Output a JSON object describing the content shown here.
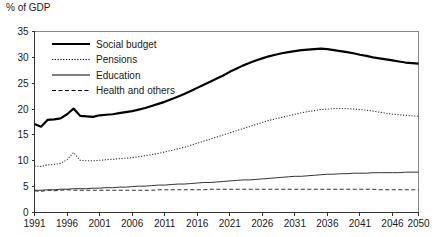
{
  "chart_data": {
    "type": "line",
    "title": "",
    "ylabel": "% of GDP",
    "xlabel": "",
    "ylim": [
      0,
      35
    ],
    "xlim": [
      1991,
      2050
    ],
    "grid": false,
    "legend_position": "top-left",
    "yticks": [
      "0",
      "5",
      "10",
      "15",
      "20",
      "25",
      "30",
      "35"
    ],
    "ytick_values": [
      0,
      5,
      10,
      15,
      20,
      25,
      30,
      35
    ],
    "xticks": [
      "1991",
      "1996",
      "2001",
      "2006",
      "2011",
      "2016",
      "2021",
      "2026",
      "2031",
      "2036",
      "2041",
      "2046",
      "2050"
    ],
    "xtick_values": [
      1991,
      1996,
      2001,
      2006,
      2011,
      2016,
      2021,
      2026,
      2031,
      2036,
      2041,
      2046,
      2050
    ],
    "x": [
      1991,
      1992,
      1993,
      1994,
      1995,
      1996,
      1997,
      1998,
      1999,
      2000,
      2001,
      2002,
      2003,
      2004,
      2005,
      2006,
      2007,
      2008,
      2009,
      2010,
      2011,
      2012,
      2013,
      2014,
      2015,
      2016,
      2017,
      2018,
      2019,
      2020,
      2021,
      2022,
      2023,
      2024,
      2025,
      2026,
      2027,
      2028,
      2029,
      2030,
      2031,
      2032,
      2033,
      2034,
      2035,
      2036,
      2037,
      2038,
      2039,
      2040,
      2041,
      2042,
      2043,
      2044,
      2045,
      2046,
      2047,
      2048,
      2049,
      2050
    ],
    "series": [
      {
        "name": "Social budget",
        "style": "thick-solid",
        "color": "#000000",
        "values": [
          17.1,
          16.6,
          17.9,
          18.0,
          18.2,
          19.0,
          20.1,
          18.7,
          18.6,
          18.5,
          18.8,
          18.9,
          19.0,
          19.2,
          19.4,
          19.6,
          19.9,
          20.2,
          20.6,
          21.0,
          21.4,
          21.9,
          22.4,
          22.9,
          23.5,
          24.1,
          24.7,
          25.3,
          25.9,
          26.5,
          27.2,
          27.8,
          28.4,
          28.9,
          29.4,
          29.8,
          30.2,
          30.5,
          30.8,
          31.0,
          31.2,
          31.4,
          31.5,
          31.6,
          31.7,
          31.6,
          31.4,
          31.2,
          31.0,
          30.8,
          30.5,
          30.3,
          30.0,
          29.8,
          29.6,
          29.4,
          29.2,
          29.0,
          28.9,
          28.8
        ]
      },
      {
        "name": "Pensions",
        "style": "dotted",
        "color": "#333333",
        "values": [
          9.0,
          8.9,
          9.2,
          9.3,
          9.5,
          10.2,
          11.6,
          10.1,
          10.0,
          10.0,
          10.1,
          10.2,
          10.3,
          10.4,
          10.5,
          10.6,
          10.8,
          11.0,
          11.2,
          11.4,
          11.7,
          12.0,
          12.3,
          12.6,
          13.0,
          13.4,
          13.8,
          14.2,
          14.6,
          15.0,
          15.4,
          15.8,
          16.2,
          16.6,
          17.0,
          17.4,
          17.8,
          18.1,
          18.4,
          18.7,
          19.0,
          19.3,
          19.5,
          19.7,
          19.9,
          20.0,
          20.1,
          20.1,
          20.1,
          20.0,
          19.9,
          19.8,
          19.6,
          19.4,
          19.2,
          19.0,
          18.9,
          18.8,
          18.7,
          18.6
        ]
      },
      {
        "name": "Education",
        "style": "thin-solid",
        "color": "#333333",
        "values": [
          4.3,
          4.3,
          4.4,
          4.4,
          4.5,
          4.5,
          4.6,
          4.6,
          4.6,
          4.7,
          4.7,
          4.8,
          4.8,
          4.9,
          4.9,
          5.0,
          5.1,
          5.1,
          5.2,
          5.3,
          5.3,
          5.4,
          5.5,
          5.5,
          5.6,
          5.7,
          5.8,
          5.8,
          5.9,
          6.0,
          6.1,
          6.2,
          6.3,
          6.3,
          6.4,
          6.5,
          6.6,
          6.7,
          6.8,
          6.9,
          7.0,
          7.0,
          7.1,
          7.2,
          7.3,
          7.4,
          7.4,
          7.5,
          7.5,
          7.6,
          7.6,
          7.6,
          7.7,
          7.7,
          7.7,
          7.7,
          7.7,
          7.8,
          7.8,
          7.8
        ]
      },
      {
        "name": "Health and others",
        "style": "dashed",
        "color": "#333333",
        "values": [
          4.2,
          4.1,
          4.3,
          4.2,
          4.3,
          4.4,
          4.3,
          4.3,
          4.3,
          4.3,
          4.3,
          4.3,
          4.3,
          4.3,
          4.3,
          4.3,
          4.3,
          4.3,
          4.3,
          4.4,
          4.4,
          4.4,
          4.4,
          4.4,
          4.4,
          4.4,
          4.4,
          4.5,
          4.5,
          4.5,
          4.5,
          4.5,
          4.5,
          4.5,
          4.5,
          4.5,
          4.5,
          4.5,
          4.5,
          4.5,
          4.5,
          4.5,
          4.5,
          4.5,
          4.5,
          4.5,
          4.5,
          4.5,
          4.5,
          4.5,
          4.5,
          4.5,
          4.5,
          4.4,
          4.4,
          4.4,
          4.4,
          4.4,
          4.4,
          4.4
        ]
      }
    ],
    "legend": [
      {
        "label": "Social budget",
        "style": "thick-solid"
      },
      {
        "label": "Pensions",
        "style": "dotted"
      },
      {
        "label": "Education",
        "style": "thin-solid"
      },
      {
        "label": "Health and others",
        "style": "dashed"
      }
    ]
  }
}
